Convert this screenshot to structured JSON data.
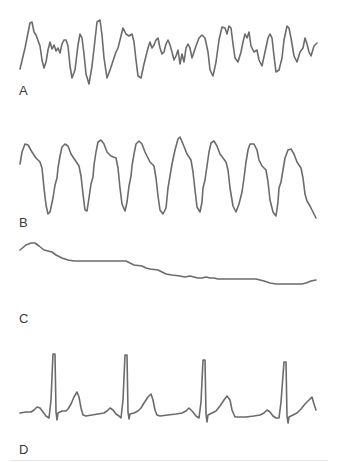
{
  "figure": {
    "panels": [
      {
        "label": "A",
        "rhythm": "chaotic irregular waveform"
      },
      {
        "label": "B",
        "rhythm": "regular wide sinusoidal complexes"
      },
      {
        "label": "C",
        "rhythm": "near-flat drifting baseline"
      },
      {
        "label": "D",
        "rhythm": "regular narrow QRS complexes with P and T waves"
      }
    ],
    "trace_color": "#6b6b6b"
  }
}
